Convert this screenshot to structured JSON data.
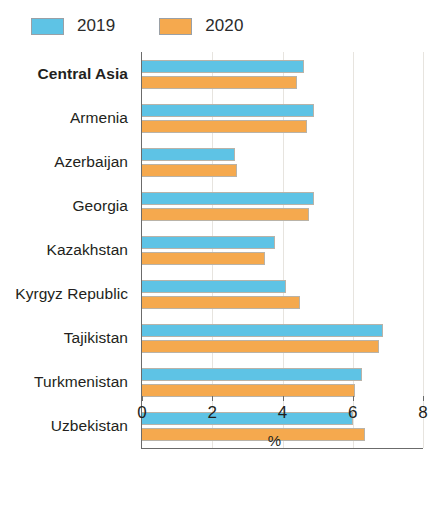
{
  "legend": {
    "position": "top-left",
    "entries": [
      {
        "label": "2019",
        "color": "#5ec3e5",
        "icon": "legend-swatch-2019"
      },
      {
        "label": "2020",
        "color": "#f5a94e",
        "icon": "legend-swatch-2020"
      }
    ]
  },
  "axis": {
    "x_label": "%",
    "x_ticks": [
      "0",
      "2",
      "4",
      "6",
      "8"
    ]
  },
  "chart_data": {
    "type": "bar",
    "orientation": "horizontal",
    "title": "",
    "subtitle": "",
    "xlabel": "%",
    "ylabel": "",
    "xlim": [
      0,
      8
    ],
    "xticks": [
      0,
      2,
      4,
      6,
      8
    ],
    "grid": "vertical-faint",
    "legend_position": "top-left",
    "emphasized_category": "Central Asia",
    "categories": [
      "Central Asia",
      "Armenia",
      "Azerbaijan",
      "Georgia",
      "Kazakhstan",
      "Kyrgyz Republic",
      "Tajikistan",
      "Turkmenistan",
      "Uzbekistan"
    ],
    "series": [
      {
        "name": "2019",
        "color": "#5ec3e5",
        "values": [
          4.6,
          4.9,
          2.65,
          4.9,
          3.8,
          4.1,
          6.85,
          6.25,
          6.0
        ]
      },
      {
        "name": "2020",
        "color": "#f5a94e",
        "values": [
          4.4,
          4.7,
          2.7,
          4.75,
          3.5,
          4.5,
          6.75,
          6.05,
          6.35
        ]
      }
    ]
  }
}
